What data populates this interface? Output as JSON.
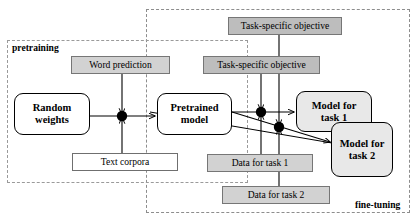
{
  "diagram": {
    "regions": [
      {
        "id": "pretraining",
        "label": "pretraining"
      },
      {
        "id": "finetuning",
        "label": "fine-tuning"
      }
    ],
    "nodes": {
      "random_weights": "Random\nweights",
      "random_weights_line1": "Random",
      "random_weights_line2": "weights",
      "pretrained_model_line1": "Pretrained",
      "pretrained_model_line2": "model",
      "model_task1_line1": "Model for",
      "model_task1_line2": "task 1",
      "model_task2_line1": "Model for",
      "model_task2_line2": "task 2",
      "word_prediction": "Word prediction",
      "task_objective_top": "Task-specific objective",
      "task_objective_mid": "Task-specific objective",
      "text_corpora": "Text corpora",
      "data_task1": "Data for task 1",
      "data_task2": "Data for task 2"
    },
    "colors": {
      "shaded_fill": "#e8e8e8",
      "gray_fill": "#bdbdbd",
      "light_gray_fill": "#d2d2d2",
      "stroke": "#000000",
      "dashed_border": "#9a9a9a",
      "junction_dot": "#000000"
    }
  }
}
